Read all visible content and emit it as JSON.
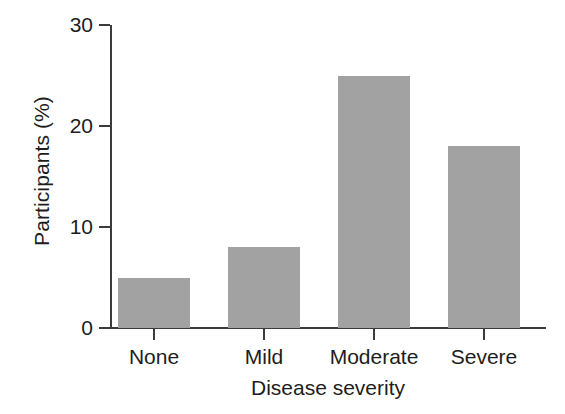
{
  "chart_data": {
    "type": "bar",
    "title": "",
    "subtitle": "",
    "categories": [
      "None",
      "Mild",
      "Moderate",
      "Severe"
    ],
    "values": [
      5,
      8,
      25,
      18
    ],
    "series": [
      {
        "name": "Participants",
        "values": [
          5,
          8,
          25,
          18
        ]
      }
    ],
    "xlabel": "Disease severity",
    "ylabel": "Participants (%)",
    "ylim": [
      0,
      30
    ],
    "yticks": [
      0,
      10,
      20,
      30
    ],
    "ytick_labels": [
      "0",
      "10",
      "20",
      "30"
    ],
    "grid": false,
    "legend": false,
    "legend_position": "none",
    "bar_color": "#a2a2a2",
    "axis_color": "#3b3b3b",
    "background_color": "#ffffff"
  },
  "axes": {
    "y_title": "Participants (%)",
    "x_title": "Disease severity"
  }
}
